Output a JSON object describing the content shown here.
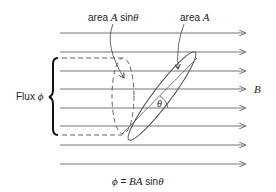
{
  "labels": {
    "area_projected_prefix": "area ",
    "area_projected_var": "A",
    "area_projected_fn": " sin",
    "area_projected_theta": "θ",
    "area_prefix": "area ",
    "area_var": "A",
    "flux_word": "Flux ",
    "flux_symbol": "ϕ",
    "field_symbol": "B",
    "angle_symbol": "θ",
    "equation_lhs": "ϕ",
    "equation_eq": " = ",
    "equation_rhs_var": "BA",
    "equation_fn": " sin",
    "equation_theta": "θ"
  },
  "field_lines": {
    "count": 8,
    "y_positions": [
      33,
      52,
      71,
      89,
      108,
      126,
      145,
      164
    ],
    "x_start": 60,
    "x_end": 246,
    "color": "#777777"
  },
  "colors": {
    "line": "#777777",
    "ink": "#222222",
    "dash": "#666666"
  }
}
